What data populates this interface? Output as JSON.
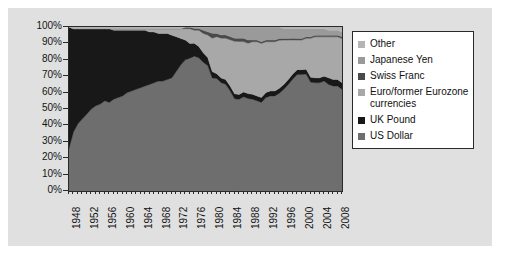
{
  "chart": {
    "background_color": "#e0e0e0",
    "plot_background_color": "#f2f2f2",
    "border_color": "#2a2a2a"
  },
  "legend": {
    "position": "right",
    "entries": [
      {
        "label": "Other",
        "color": "#b4b4b4"
      },
      {
        "label": "Japanese Yen",
        "color": "#9a9a9a"
      },
      {
        "label": "Swiss Franc",
        "color": "#4a4a4a"
      },
      {
        "label": "Euro/former Eurozone currencies",
        "color": "#a8a8a8"
      },
      {
        "label": "UK Pound",
        "color": "#181818"
      },
      {
        "label": "US Dollar",
        "color": "#6e6e6e"
      }
    ]
  },
  "y_axis": {
    "ticks": [
      "100%",
      "90%",
      "80%",
      "70%",
      "60%",
      "50%",
      "40%",
      "30%",
      "20%",
      "10%",
      "0%"
    ]
  },
  "x_axis": {
    "ticks": [
      "1948",
      "1952",
      "1956",
      "1960",
      "1964",
      "1968",
      "1972",
      "1976",
      "1980",
      "1984",
      "1988",
      "1992",
      "1996",
      "2000",
      "2004",
      "2008"
    ]
  },
  "chart_data": {
    "type": "area",
    "title": "",
    "xlabel": "",
    "ylabel": "",
    "stacked": true,
    "normalized": true,
    "ylim": [
      0,
      100
    ],
    "grid": false,
    "legend_position": "right",
    "x": [
      1948,
      1949,
      1950,
      1951,
      1952,
      1953,
      1954,
      1955,
      1956,
      1957,
      1958,
      1959,
      1960,
      1961,
      1962,
      1963,
      1964,
      1965,
      1966,
      1967,
      1968,
      1969,
      1970,
      1971,
      1972,
      1973,
      1974,
      1975,
      1976,
      1977,
      1978,
      1979,
      1980,
      1981,
      1982,
      1983,
      1984,
      1985,
      1986,
      1987,
      1988,
      1989,
      1990,
      1991,
      1992,
      1993,
      1994,
      1995,
      1996,
      1997,
      1998,
      1999,
      2000,
      2001,
      2002,
      2003,
      2004,
      2005,
      2006,
      2007,
      2008,
      2009
    ],
    "series": [
      {
        "name": "US Dollar",
        "color": "#6e6e6e",
        "values": [
          26,
          36,
          41,
          44,
          47,
          50,
          52,
          53,
          55,
          54,
          56,
          57,
          58,
          60,
          61,
          62,
          63,
          64,
          65,
          66,
          67,
          67,
          68,
          69,
          73,
          77,
          80,
          81,
          83,
          82,
          80,
          78,
          71,
          70,
          68,
          67,
          63,
          58,
          57,
          58,
          57,
          56,
          55,
          54,
          57,
          58,
          58,
          59,
          62,
          65,
          69,
          71,
          71,
          72,
          67,
          66,
          66,
          67,
          65,
          64,
          64,
          62
        ],
        "description": "Share of global foreign exchange reserves held in US Dollars"
      },
      {
        "name": "UK Pound",
        "color": "#181818",
        "values": [
          74,
          63,
          58,
          55,
          52,
          49,
          47,
          46,
          44,
          45,
          42,
          41,
          40,
          38,
          37,
          36,
          35,
          34,
          32,
          31,
          29,
          29,
          28,
          26,
          21,
          16,
          12,
          9,
          8,
          7,
          6,
          5,
          4,
          3,
          3,
          3,
          3,
          3,
          3,
          3,
          3,
          3,
          3,
          3,
          3,
          3,
          3,
          3,
          3,
          3,
          3,
          3,
          3,
          3,
          3,
          3,
          3,
          3,
          4,
          4,
          4,
          4
        ],
        "description": "Share of global foreign exchange reserves held in UK Pounds"
      },
      {
        "name": "Euro/former Eurozone currencies",
        "color": "#a8a8a8",
        "values": [
          0,
          0,
          0,
          0,
          0,
          0,
          0,
          0,
          0,
          0,
          1,
          1,
          1,
          1,
          1,
          1,
          1,
          1,
          2,
          2,
          3,
          3,
          3,
          4,
          5,
          6,
          7,
          9,
          8,
          10,
          12,
          14,
          21,
          23,
          25,
          26,
          29,
          33,
          33,
          31,
          31,
          32,
          33,
          33,
          31,
          30,
          30,
          29,
          27,
          24,
          21,
          18,
          18,
          19,
          24,
          25,
          25,
          24,
          25,
          26,
          26,
          27
        ],
        "description": "Share of global foreign exchange reserves held in the Euro and its legacy currencies (Deutsche Mark, French Franc, Dutch Guilder, ECU)"
      },
      {
        "name": "Swiss Franc",
        "color": "#4a4a4a",
        "values": [
          0,
          0,
          0,
          0,
          0,
          0,
          0,
          0,
          0,
          0,
          0,
          0,
          0,
          0,
          0,
          0,
          0,
          0,
          0,
          0,
          0,
          0,
          0,
          0,
          0,
          0,
          1,
          1,
          1,
          1,
          2,
          2,
          3,
          2,
          2,
          2,
          2,
          2,
          2,
          2,
          2,
          1,
          1,
          1,
          1,
          1,
          1,
          1,
          1,
          1,
          1,
          1,
          1,
          1,
          1,
          1,
          1,
          1,
          1,
          1,
          1,
          1
        ],
        "description": "Share of global foreign exchange reserves held in Swiss Francs"
      },
      {
        "name": "Japanese Yen",
        "color": "#9a9a9a",
        "values": [
          0,
          0,
          0,
          0,
          0,
          0,
          0,
          0,
          0,
          0,
          0,
          0,
          0,
          0,
          0,
          0,
          0,
          0,
          0,
          0,
          0,
          0,
          0,
          0,
          0,
          0,
          0,
          0,
          1,
          1,
          2,
          3,
          4,
          4,
          5,
          5,
          6,
          7,
          7,
          7,
          8,
          8,
          8,
          9,
          8,
          8,
          8,
          7,
          6,
          6,
          6,
          6,
          6,
          5,
          5,
          4,
          4,
          4,
          3,
          3,
          3,
          3
        ],
        "description": "Share of global foreign exchange reserves held in Japanese Yen"
      },
      {
        "name": "Other",
        "color": "#b4b4b4",
        "values": [
          0,
          1,
          1,
          1,
          1,
          1,
          1,
          1,
          1,
          1,
          1,
          1,
          1,
          1,
          1,
          1,
          1,
          1,
          1,
          1,
          1,
          1,
          1,
          1,
          1,
          1,
          0,
          0,
          0,
          0,
          0,
          0,
          0,
          0,
          0,
          0,
          0,
          0,
          0,
          0,
          0,
          0,
          0,
          0,
          0,
          0,
          0,
          0,
          1,
          1,
          1,
          1,
          1,
          1,
          1,
          1,
          1,
          1,
          2,
          2,
          2,
          3
        ],
        "description": "Share of global foreign exchange reserves held in other currencies"
      }
    ]
  }
}
